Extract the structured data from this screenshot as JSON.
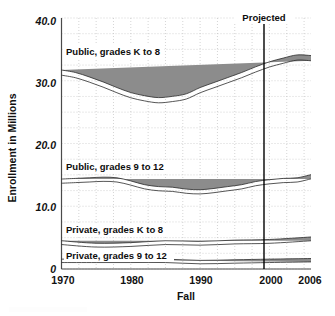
{
  "chart_data": {
    "type": "line",
    "title": "",
    "xlabel": "Fall",
    "ylabel": "Enrollment in Millions",
    "xlim": [
      1970,
      2006
    ],
    "ylim": [
      0,
      40
    ],
    "grid": true,
    "legend_position": "inline-labels",
    "y_ticks": [
      "40.0",
      "30.0",
      "20.0",
      "10.0",
      "0"
    ],
    "y_tick_values": [
      40,
      30,
      20,
      10,
      0
    ],
    "x_ticks": [
      "1970",
      "1980",
      "1990",
      "2000",
      "2006"
    ],
    "x_tick_values": [
      1970,
      1980,
      1990,
      2000,
      2006
    ],
    "annotations": [
      {
        "text": "Projected",
        "x": 1998,
        "type": "vertical-line-label"
      }
    ],
    "series": [
      {
        "name": "Public, grades K to 8",
        "label": "Public, grades K to 8",
        "color": "#8c8c8c",
        "x": [
          1970,
          1972,
          1974,
          1976,
          1978,
          1980,
          1982,
          1984,
          1986,
          1988,
          1990,
          1992,
          1994,
          1996,
          1998,
          2000,
          2002,
          2004,
          2006
        ],
        "values": [
          31.3,
          30.9,
          30.2,
          29.4,
          28.5,
          27.7,
          27.2,
          26.9,
          27.1,
          27.5,
          28.5,
          29.3,
          30.1,
          30.9,
          31.8,
          32.6,
          33.2,
          33.7,
          33.6
        ]
      },
      {
        "name": "Public, grades 9 to 12",
        "label": "Public, grades 9 to 12",
        "color": "#8c8c8c",
        "x": [
          1970,
          1972,
          1974,
          1976,
          1978,
          1980,
          1982,
          1984,
          1986,
          1988,
          1990,
          1992,
          1994,
          1996,
          1998,
          2000,
          2002,
          2004,
          2006
        ],
        "values": [
          14.0,
          14.1,
          14.2,
          14.3,
          14.2,
          13.7,
          13.1,
          12.8,
          12.7,
          12.4,
          12.3,
          12.5,
          12.8,
          13.1,
          13.6,
          13.9,
          14.1,
          14.2,
          14.7
        ]
      },
      {
        "name": "Private, grades K to 8",
        "label": "Private, grades K to 8",
        "color": "#8c8c8c",
        "x": [
          1970,
          1975,
          1980,
          1985,
          1990,
          1995,
          2000,
          2006
        ],
        "values": [
          4.2,
          3.8,
          3.9,
          4.2,
          4.1,
          4.3,
          4.4,
          4.8
        ]
      },
      {
        "name": "Private, grades 9 to 12",
        "label": "Private, grades 9 to 12",
        "color": "#8c8c8c",
        "x": [
          1970,
          1975,
          1980,
          1985,
          1990,
          1995,
          2000,
          2006
        ],
        "values": [
          1.3,
          1.3,
          1.3,
          1.3,
          1.1,
          1.2,
          1.3,
          1.4
        ]
      }
    ]
  },
  "labels": {
    "series_0": "Public, grades K to 8",
    "series_1": "Public, grades 9 to 12",
    "series_2": "Private, grades K to 8",
    "series_3": "Private, grades 9 to 12",
    "projected": "Projected",
    "x_title": "Fall",
    "y_title": "Enrollment in Millions",
    "y0": "40.0",
    "y1": "30.0",
    "y2": "20.0",
    "y3": "10.0",
    "y4": "0",
    "x0": "1970",
    "x1": "1980",
    "x2": "1990",
    "x3": "2000",
    "x4": "2006"
  }
}
